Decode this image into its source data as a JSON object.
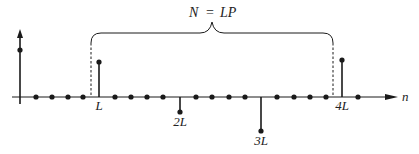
{
  "diagram": {
    "title_equation": {
      "lhs": "N",
      "op": "=",
      "rhs": "LP"
    },
    "axis": {
      "label": "n",
      "baseline_y": 97,
      "x_start": 12,
      "x_end": 398
    },
    "sample_spacing_px": 16.2,
    "origin_sample": {
      "label": "",
      "x": 20,
      "value": "positive",
      "dot_y": 50,
      "arrow": true
    },
    "zero_samples_x": [
      36,
      52,
      68,
      83,
      115,
      131,
      147,
      163,
      196,
      212,
      229,
      245,
      277,
      294,
      310,
      326,
      358
    ],
    "nonzero_samples": [
      {
        "label": "L",
        "x": 99,
        "dot_y": 62,
        "direction": "up"
      },
      {
        "label": "2L",
        "x": 180,
        "dot_y": 112,
        "direction": "down"
      },
      {
        "label": "3L",
        "x": 261,
        "dot_y": 131,
        "direction": "down"
      },
      {
        "label": "4L",
        "x": 342,
        "dot_y": 60,
        "direction": "up"
      }
    ],
    "period_brace": {
      "x_left": 91,
      "x_right": 333,
      "y": 33,
      "peak_x": 212,
      "peak_y": 22,
      "label": "N = LP"
    },
    "dashed_markers": [
      {
        "x": 91
      },
      {
        "x": 333
      }
    ],
    "colors": {
      "ink": "#1a1a1a",
      "background": "#ffffff"
    }
  }
}
